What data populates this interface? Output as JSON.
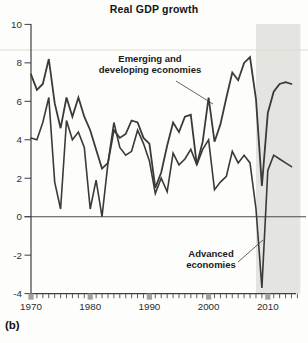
{
  "panel_label": "(b)",
  "chart_data": {
    "type": "line",
    "title": "Real GDP growth",
    "xlabel": "",
    "ylabel": "",
    "x": [
      1970,
      1971,
      1972,
      1973,
      1974,
      1975,
      1976,
      1977,
      1978,
      1979,
      1980,
      1981,
      1982,
      1983,
      1984,
      1985,
      1986,
      1987,
      1988,
      1989,
      1990,
      1991,
      1992,
      1993,
      1994,
      1995,
      1996,
      1997,
      1998,
      1999,
      2000,
      2001,
      2002,
      2003,
      2004,
      2005,
      2006,
      2007,
      2008,
      2009,
      2010,
      2011,
      2012,
      2013,
      2014
    ],
    "series": [
      {
        "name": "Emerging and developing economies",
        "values": [
          7.4,
          6.6,
          6.9,
          8.2,
          5.9,
          4.6,
          6.2,
          5.2,
          6.2,
          5.2,
          4.5,
          3.5,
          2.5,
          2.8,
          4.5,
          4.1,
          4.3,
          5.0,
          4.9,
          4.1,
          3.8,
          1.5,
          2.3,
          3.7,
          4.9,
          4.4,
          5.2,
          5.3,
          2.7,
          3.9,
          6.2,
          3.9,
          4.8,
          6.2,
          7.5,
          7.1,
          8.0,
          8.3,
          6.1,
          1.6,
          5.4,
          6.5,
          6.9,
          7.0,
          6.9
        ]
      },
      {
        "name": "Advanced economies",
        "values": [
          4.1,
          4.0,
          4.9,
          6.2,
          1.8,
          0.4,
          5.0,
          4.0,
          4.4,
          3.6,
          0.4,
          1.9,
          0.0,
          2.8,
          4.9,
          3.6,
          3.2,
          3.4,
          4.5,
          3.8,
          2.9,
          1.2,
          2.0,
          1.3,
          3.3,
          2.7,
          3.0,
          3.5,
          2.7,
          3.5,
          4.0,
          1.4,
          1.8,
          2.1,
          3.4,
          2.8,
          3.2,
          2.8,
          0.4,
          -3.7,
          2.4,
          3.2,
          3.0,
          2.8,
          2.6
        ]
      }
    ],
    "ylim": [
      -4,
      10
    ],
    "yticks": [
      10,
      8,
      6,
      4,
      2,
      0,
      -2,
      -4
    ],
    "xtick_labels": [
      "1970",
      "1980",
      "1990",
      "2000",
      "2010"
    ],
    "xtick_label_years": [
      1970,
      1980,
      1990,
      2000,
      2010
    ],
    "minor_xticks_every_year_from": 1970,
    "minor_xticks_every_year_to": 2015,
    "grid": "off",
    "zero_line": true,
    "legend_position": "in-plot annotations with pointer lines",
    "shaded_region": {
      "from_year": 2008,
      "to_year": 2015.5,
      "color": "#e4e4e0"
    },
    "line_color": "#3a3a3a",
    "axis_color": "#3f3f3f",
    "decade_tick_color": "#a0a09e",
    "annotations": [
      {
        "id": "emerging-label",
        "lines": [
          "Emerging and",
          "developing economies"
        ],
        "cx": 150,
        "top": 54,
        "pointer": {
          "x1": 176,
          "y1": 81,
          "x2": 213,
          "y2": 104
        }
      },
      {
        "id": "advanced-label",
        "lines": [
          "Advanced",
          "economies"
        ],
        "cx": 211,
        "top": 249,
        "pointer": {
          "x1": 238,
          "y1": 262,
          "x2": 263,
          "y2": 240
        }
      }
    ]
  }
}
